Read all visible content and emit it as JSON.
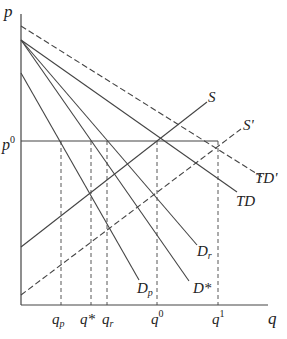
{
  "diagram": {
    "axes": {
      "y_label": "p",
      "x_label": "q",
      "p0_label": "p",
      "p0_sup": "0"
    },
    "curves": {
      "TD_prime": "TD'",
      "TD": "TD",
      "D_r_base": "D",
      "D_r_sub": "r",
      "D_star": "D*",
      "D_p_base": "D",
      "D_p_sub": "p",
      "S": "S",
      "S_prime": "S'"
    },
    "x_ticks": {
      "q_p_base": "q",
      "q_p_sub": "p",
      "q_star": "q*",
      "q_r_base": "q",
      "q_r_sub": "r",
      "q0_base": "q",
      "q0_sup": "0",
      "q1_base": "q",
      "q1_sup": "1"
    },
    "colors": {
      "line": "#444444",
      "background": "#ffffff"
    }
  }
}
